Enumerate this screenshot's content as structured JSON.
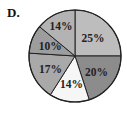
{
  "panel_label": "D.",
  "chart_data": {
    "type": "pie",
    "title": "",
    "start_angle_deg": 0,
    "direction": "clockwise",
    "slices": [
      {
        "label": "25%",
        "value": 25,
        "color": "#bdbdbd"
      },
      {
        "label": "20%",
        "value": 20,
        "color": "#8c8c8c"
      },
      {
        "label": "14%",
        "value": 14,
        "color": "#f6f6f6"
      },
      {
        "label": "17%",
        "value": 17,
        "color": "#a9a9a9"
      },
      {
        "label": "10%",
        "value": 10,
        "color": "#9d9d9d"
      },
      {
        "label": "14%",
        "value": 14,
        "color": "#b3b3b3"
      }
    ],
    "categories": [
      "25%",
      "20%",
      "14%",
      "17%",
      "10%",
      "14%"
    ],
    "values": [
      25,
      20,
      14,
      17,
      10,
      14
    ]
  }
}
